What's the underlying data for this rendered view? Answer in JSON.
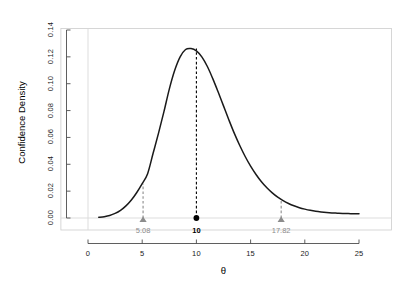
{
  "chart_data": {
    "type": "line",
    "title": "",
    "subtitle": "",
    "xlabel": "θ",
    "ylabel": "Confidence Density",
    "xlim": [
      -2.5,
      28
    ],
    "ylim": [
      0.0,
      0.14
    ],
    "grid": false,
    "legend": null,
    "x_ticks": [
      "0",
      "5",
      "10",
      "15",
      "20",
      "25"
    ],
    "x_tick_values": [
      0,
      5,
      10,
      15,
      20,
      25
    ],
    "y_ticks": [
      "0.00",
      "0.02",
      "0.04",
      "0.06",
      "0.08",
      "0.10",
      "0.12",
      "0.14"
    ],
    "y_tick_values": [
      0.0,
      0.02,
      0.04,
      0.06,
      0.08,
      0.1,
      0.12,
      0.14
    ],
    "series": [
      {
        "name": "Confidence Density",
        "color": "#1a1a1a",
        "x": [
          1.0,
          1.5,
          2.0,
          2.5,
          3.0,
          3.5,
          4.0,
          4.5,
          5.0,
          5.5,
          6.0,
          6.5,
          7.0,
          7.5,
          8.0,
          8.5,
          9.0,
          9.5,
          10.0,
          10.5,
          11.0,
          11.5,
          12.0,
          12.5,
          13.0,
          13.5,
          14.0,
          14.5,
          15.0,
          15.5,
          16.0,
          16.5,
          17.0,
          17.5,
          18.0,
          18.5,
          19.0,
          19.5,
          20.0,
          20.5,
          21.0,
          21.5,
          22.0,
          22.5,
          23.0,
          23.5,
          24.0,
          24.5,
          25.0
        ],
        "y": [
          0.0005,
          0.001,
          0.0019,
          0.0034,
          0.0057,
          0.009,
          0.0134,
          0.019,
          0.0256,
          0.033,
          0.048,
          0.063,
          0.079,
          0.096,
          0.11,
          0.12,
          0.1255,
          0.1262,
          0.1245,
          0.12,
          0.113,
          0.104,
          0.094,
          0.0835,
          0.073,
          0.063,
          0.054,
          0.0458,
          0.0386,
          0.0324,
          0.027,
          0.0225,
          0.0187,
          0.0155,
          0.0129,
          0.0108,
          0.0091,
          0.0077,
          0.0066,
          0.0057,
          0.005,
          0.0045,
          0.0041,
          0.0038,
          0.0036,
          0.0034,
          0.0033,
          0.0032,
          0.0031
        ]
      }
    ],
    "annotations": [
      {
        "name": "lower-bound",
        "x": 5.08,
        "y": 0.0,
        "label": "5.08",
        "marker": "triangle",
        "color": "#8c8c8c",
        "dash_to": 0.0255,
        "label_bold": false
      },
      {
        "name": "point-estimate",
        "x": 10.0,
        "y": 0.0,
        "label": "10",
        "marker": "circle",
        "color": "#000000",
        "dash_to": 0.1262,
        "label_bold": true
      },
      {
        "name": "upper-bound",
        "x": 17.82,
        "y": 0.0,
        "label": "17.82",
        "marker": "triangle",
        "color": "#8c8c8c",
        "dash_to": 0.014,
        "label_bold": false
      }
    ],
    "reference_lines": [
      {
        "name": "vertical-zero-line",
        "orientation": "vertical",
        "value": 0,
        "color": "#d9d9d9"
      },
      {
        "name": "horizontal-zero-line",
        "orientation": "horizontal",
        "value": 0.0,
        "color": "#d9d9d9"
      }
    ],
    "peak": {
      "x": 9.5,
      "y": 0.126
    },
    "colors": {
      "curve": "#1a1a1a",
      "accent_gray": "#8c8c8c",
      "reference": "#d9d9d9",
      "border": "#cccccc",
      "axis": "#4d4d4d",
      "background": "#ffffff"
    }
  }
}
